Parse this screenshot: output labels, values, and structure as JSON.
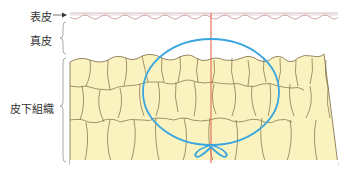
{
  "diagram": {
    "labels": {
      "epidermis": "表皮",
      "dermis": "真皮",
      "subcutaneous": "皮下組織"
    },
    "colors": {
      "fat_fill": "#fbf3bf",
      "cell_border": "#7a6a44",
      "surface_line": "#d98a8a",
      "needle_line": "#e8735a",
      "circle": "#3aa6e0",
      "bracket": "#9a9a9a",
      "surface_band": "#ece6ec"
    }
  }
}
